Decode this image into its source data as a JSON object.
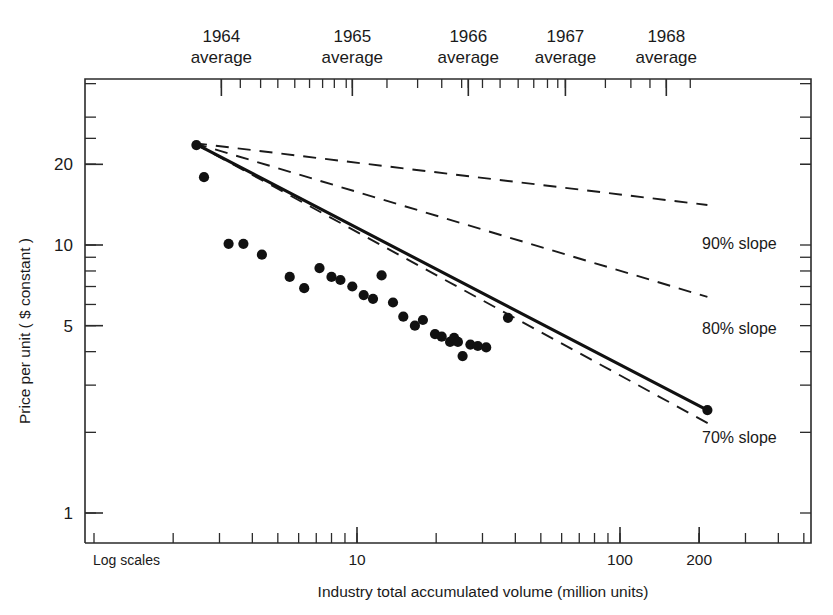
{
  "chart_data": {
    "type": "scatter",
    "title": "",
    "xlabel": "Industry total accumulated volume (million units)",
    "ylabel": "Price per unit ( $ constant )",
    "note": "Log scales",
    "xscale": "log",
    "yscale": "log",
    "xlim": [
      2.15,
      255
    ],
    "ylim": [
      0.85,
      27
    ],
    "grid": false,
    "x_tick_labels": [
      {
        "value": 10,
        "label": "10"
      },
      {
        "value": 100,
        "label": "100"
      },
      {
        "value": 200,
        "label": "200"
      }
    ],
    "y_tick_labels": [
      {
        "value": 20,
        "label": "20"
      },
      {
        "value": 10,
        "label": "10"
      },
      {
        "value": 5,
        "label": "5"
      },
      {
        "value": 1,
        "label": "1"
      }
    ],
    "top_axis_label": "year average markers",
    "top_axis_ticks": [
      {
        "label_line1": "1964",
        "label_line2": "average",
        "value": 3.05
      },
      {
        "label_line1": "1965",
        "label_line2": "average",
        "value": 9.6
      },
      {
        "label_line1": "1966",
        "label_line2": "average",
        "value": 26.5
      },
      {
        "label_line1": "1967",
        "label_line2": "average",
        "value": 62.0
      },
      {
        "label_line1": "1968",
        "label_line2": "average",
        "value": 150.0
      }
    ],
    "top_axis_minor_ticks": [
      3.05,
      3.6,
      4.3,
      5.0,
      5.8,
      6.6,
      7.4,
      8.2,
      9.1,
      9.6,
      13.0,
      17.0,
      21.0,
      25.0,
      26.5,
      30.0,
      35.0,
      41.0,
      47.0,
      53.0,
      58.0,
      62.0,
      88.0,
      110.0,
      130.0,
      150.0,
      185.0
    ],
    "series": [
      {
        "name": "90% slope",
        "type": "line",
        "style": "dashed",
        "label": "90% slope",
        "label_x": 205,
        "label_y": 9.7,
        "points": [
          [
            2.4,
            24.0
          ],
          [
            215,
            14.1
          ]
        ]
      },
      {
        "name": "80% slope",
        "type": "line",
        "style": "dashed",
        "label": "80% slope",
        "label_x": 205,
        "label_y": 4.65,
        "points": [
          [
            2.4,
            24.0
          ],
          [
            215,
            6.4
          ]
        ]
      },
      {
        "name": "70% slope",
        "type": "line",
        "style": "dashed",
        "label": "70% slope",
        "label_x": 205,
        "label_y": 1.82,
        "points": [
          [
            2.4,
            24.0
          ],
          [
            228,
            2.1
          ]
        ]
      },
      {
        "name": "fitted experience curve",
        "type": "line",
        "style": "solid",
        "points": [
          [
            2.4,
            24.0
          ],
          [
            215,
            2.42
          ]
        ]
      }
    ],
    "scatter": {
      "name": "observed price per unit",
      "marker": "filled-circle",
      "points": [
        [
          2.45,
          23.6
        ],
        [
          2.62,
          17.9
        ],
        [
          3.25,
          10.1
        ],
        [
          3.7,
          10.1
        ],
        [
          4.35,
          9.2
        ],
        [
          5.55,
          7.6
        ],
        [
          6.3,
          6.9
        ],
        [
          7.2,
          8.2
        ],
        [
          8.0,
          7.6
        ],
        [
          8.65,
          7.4
        ],
        [
          9.6,
          7.0
        ],
        [
          10.6,
          6.5
        ],
        [
          11.5,
          6.3
        ],
        [
          12.4,
          7.7
        ],
        [
          13.7,
          6.1
        ],
        [
          15.0,
          5.4
        ],
        [
          16.6,
          5.0
        ],
        [
          17.8,
          5.25
        ],
        [
          19.8,
          4.65
        ],
        [
          21.0,
          4.55
        ],
        [
          22.6,
          4.35
        ],
        [
          23.4,
          4.5
        ],
        [
          24.2,
          4.35
        ],
        [
          25.2,
          3.85
        ],
        [
          27.0,
          4.25
        ],
        [
          28.8,
          4.2
        ],
        [
          31.0,
          4.15
        ],
        [
          37.5,
          5.35
        ],
        [
          215,
          2.42
        ]
      ]
    }
  },
  "labels": {
    "y_axis_title": "Price per unit ( $ constant )",
    "x_axis_title": "Industry total accumulated volume (million units)",
    "log_scales": "Log scales"
  }
}
